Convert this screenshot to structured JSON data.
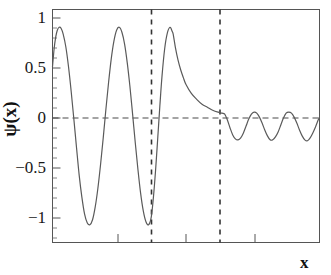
{
  "chart_data": {
    "type": "line",
    "title": "",
    "subtitle": "",
    "xlabel": "x",
    "ylabel": "ψ(x)",
    "xlim": [
      0,
      10
    ],
    "ylim": [
      -1.18,
      1.18
    ],
    "grid": false,
    "legend": null,
    "annotations": [
      {
        "name": "barrier-left-edge",
        "type": "vline",
        "x": 3.7,
        "style": "dashed"
      },
      {
        "name": "barrier-right-edge",
        "type": "vline",
        "x": 6.25,
        "style": "dashed"
      },
      {
        "name": "zero-axis",
        "type": "hline",
        "y": 0,
        "style": "dashed"
      }
    ],
    "y_ticks": [
      {
        "value": 1,
        "label": "1"
      },
      {
        "value": 0.5,
        "label": "0.5"
      },
      {
        "value": 0,
        "label": "0"
      },
      {
        "value": -0.5,
        "label": "−0.5"
      },
      {
        "value": -1,
        "label": "−1"
      }
    ],
    "y_minor_tick_step": 0.1,
    "x_ticks": [
      {
        "value": 2.45,
        "label": ""
      },
      {
        "value": 5.0,
        "label": ""
      },
      {
        "value": 7.55,
        "label": ""
      }
    ],
    "series": [
      {
        "name": "wavefunction",
        "color": "#5a5a5a",
        "line_width": 1.2,
        "regions": [
          {
            "name": "incident-oscillation",
            "x_range": [
              0,
              3.7
            ],
            "description": "sinusoidal oscillation, amplitude 1, about 3 full crests",
            "amplitude": 1.0,
            "wavelength": 1.26,
            "peaks_y": [
              1.0,
              1.0,
              1.0
            ],
            "troughs_y": [
              -1.0,
              -1.0
            ]
          },
          {
            "name": "barrier-exponential-decay",
            "x_range": [
              3.7,
              6.25
            ],
            "description": "exponential decay inside barrier",
            "y_start": 0.93,
            "y_end": 0.12
          },
          {
            "name": "transmitted-oscillation",
            "x_range": [
              6.25,
              10
            ],
            "description": "small-amplitude sinusoidal oscillation past barrier",
            "amplitude": 0.14,
            "wavelength": 1.26,
            "peaks_y": [
              0.14,
              0.14,
              0.14
            ],
            "troughs_y": [
              -0.14,
              -0.14,
              -0.14
            ]
          }
        ],
        "points": [
          [
            0.0,
            0.6
          ],
          [
            0.06,
            0.78
          ],
          [
            0.12,
            0.9
          ],
          [
            0.18,
            0.97
          ],
          [
            0.25,
            1.0
          ],
          [
            0.32,
            0.99
          ],
          [
            0.4,
            0.93
          ],
          [
            0.5,
            0.8
          ],
          [
            0.6,
            0.6
          ],
          [
            0.7,
            0.35
          ],
          [
            0.8,
            0.07
          ],
          [
            0.9,
            -0.22
          ],
          [
            1.0,
            -0.5
          ],
          [
            1.1,
            -0.72
          ],
          [
            1.2,
            -0.89
          ],
          [
            1.3,
            -0.98
          ],
          [
            1.4,
            -1.0
          ],
          [
            1.5,
            -0.95
          ],
          [
            1.6,
            -0.82
          ],
          [
            1.7,
            -0.63
          ],
          [
            1.8,
            -0.39
          ],
          [
            1.9,
            -0.12
          ],
          [
            2.0,
            0.17
          ],
          [
            2.1,
            0.44
          ],
          [
            2.2,
            0.68
          ],
          [
            2.3,
            0.86
          ],
          [
            2.4,
            0.97
          ],
          [
            2.5,
            1.0
          ],
          [
            2.6,
            0.95
          ],
          [
            2.7,
            0.83
          ],
          [
            2.8,
            0.64
          ],
          [
            2.9,
            0.4
          ],
          [
            3.0,
            0.12
          ],
          [
            3.1,
            -0.17
          ],
          [
            3.2,
            -0.44
          ],
          [
            3.3,
            -0.68
          ],
          [
            3.4,
            -0.86
          ],
          [
            3.5,
            -0.97
          ],
          [
            3.6,
            -1.0
          ],
          [
            3.7,
            -0.92
          ],
          [
            3.78,
            -0.72
          ],
          [
            3.86,
            -0.45
          ],
          [
            3.94,
            -0.13
          ],
          [
            4.02,
            0.2
          ],
          [
            4.1,
            0.5
          ],
          [
            4.2,
            0.78
          ],
          [
            4.3,
            0.94
          ],
          [
            4.4,
            1.0
          ],
          [
            4.48,
            0.96
          ],
          [
            4.52,
            0.93
          ],
          [
            4.6,
            0.8
          ],
          [
            4.7,
            0.67
          ],
          [
            4.8,
            0.57
          ],
          [
            4.9,
            0.49
          ],
          [
            5.0,
            0.42
          ],
          [
            5.2,
            0.33
          ],
          [
            5.4,
            0.27
          ],
          [
            5.6,
            0.22
          ],
          [
            5.8,
            0.19
          ],
          [
            6.0,
            0.16
          ],
          [
            6.2,
            0.14
          ],
          [
            6.35,
            0.13
          ],
          [
            6.45,
            0.12
          ],
          [
            6.55,
            0.06
          ],
          [
            6.65,
            -0.02
          ],
          [
            6.75,
            -0.09
          ],
          [
            6.85,
            -0.13
          ],
          [
            6.95,
            -0.14
          ],
          [
            7.05,
            -0.12
          ],
          [
            7.15,
            -0.07
          ],
          [
            7.25,
            0.0
          ],
          [
            7.35,
            0.07
          ],
          [
            7.45,
            0.12
          ],
          [
            7.55,
            0.14
          ],
          [
            7.65,
            0.13
          ],
          [
            7.75,
            0.09
          ],
          [
            7.85,
            0.03
          ],
          [
            7.95,
            -0.04
          ],
          [
            8.05,
            -0.1
          ],
          [
            8.15,
            -0.14
          ],
          [
            8.25,
            -0.14
          ],
          [
            8.35,
            -0.11
          ],
          [
            8.45,
            -0.06
          ],
          [
            8.55,
            0.01
          ],
          [
            8.65,
            0.08
          ],
          [
            8.75,
            0.13
          ],
          [
            8.85,
            0.14
          ],
          [
            8.95,
            0.13
          ],
          [
            9.05,
            0.09
          ],
          [
            9.15,
            0.03
          ],
          [
            9.25,
            -0.04
          ],
          [
            9.35,
            -0.1
          ],
          [
            9.45,
            -0.14
          ],
          [
            9.55,
            -0.15
          ],
          [
            9.65,
            -0.12
          ],
          [
            9.75,
            -0.07
          ],
          [
            9.85,
            -0.01
          ],
          [
            9.95,
            0.06
          ],
          [
            10.0,
            0.09
          ]
        ]
      }
    ],
    "colors": {
      "curve": "#5a5a5a",
      "axis": "#555555",
      "dashed": "#3a3a3a",
      "text": "#161616",
      "background": "#ffffff"
    }
  }
}
